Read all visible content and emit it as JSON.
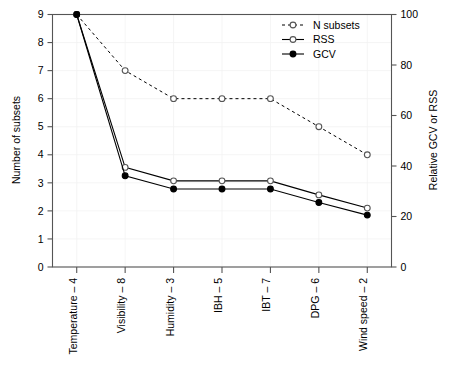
{
  "chart_data": {
    "type": "line",
    "title": "",
    "xlabel": "",
    "ylabel": "Number of subsets",
    "y2label": "Relative GCV or RSS",
    "categories": [
      "Temperature – 4",
      "Visibility – 8",
      "Humidity – 3",
      "IBH – 5",
      "IBT – 7",
      "DPG – 6",
      "Wind speed – 2"
    ],
    "ylim": [
      0,
      9
    ],
    "yticks": [
      "0",
      "1",
      "2",
      "3",
      "4",
      "5",
      "6",
      "7",
      "8",
      "9"
    ],
    "ytick_values": [
      0,
      1,
      2,
      3,
      4,
      5,
      6,
      7,
      8,
      9
    ],
    "y2lim": [
      0,
      100
    ],
    "y2ticks": [
      "0",
      "20",
      "40",
      "60",
      "80",
      "100"
    ],
    "y2tick_values": [
      0,
      20,
      40,
      60,
      80,
      100
    ],
    "grid": true,
    "legend_position": "top-right",
    "series": [
      {
        "name": "N subsets",
        "axis": "left",
        "marker": "open-circle",
        "linestyle": "dashed",
        "values": [
          9,
          7,
          6,
          6,
          6,
          5,
          4
        ]
      },
      {
        "name": "RSS",
        "axis": "left",
        "marker": "open-circle",
        "linestyle": "solid",
        "values": [
          9,
          3.55,
          3.07,
          3.07,
          3.07,
          2.57,
          2.1
        ]
      },
      {
        "name": "GCV",
        "axis": "left",
        "marker": "filled-circle",
        "linestyle": "solid",
        "values": [
          9,
          3.25,
          2.78,
          2.78,
          2.78,
          2.3,
          1.85
        ]
      }
    ]
  },
  "legend": {
    "items": [
      {
        "label": "N subsets"
      },
      {
        "label": "RSS"
      },
      {
        "label": "GCV"
      }
    ]
  },
  "axes": {
    "left_title": "Number of subsets",
    "right_title": "Relative GCV or RSS"
  },
  "colors": {
    "line": "#000000",
    "frame": "#555555",
    "grid": "#f2f2f2",
    "background": "#ffffff"
  }
}
